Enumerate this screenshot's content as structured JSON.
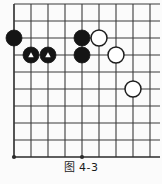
{
  "figure": {
    "caption": "图 4-3",
    "kind": "go-board-diagram"
  },
  "board": {
    "cols": 9,
    "rows": 9,
    "origin_x": 14,
    "origin_y": 21,
    "spacing": 17,
    "line_color": "#3b3b3b",
    "edge_line_color": "#2b2b2b",
    "background": "#fbfbfb",
    "stone_radius": 8.0,
    "black_color": "#151515",
    "white_color": "#ffffff",
    "white_outline": "#1d1d1d",
    "marker_color": "#ffffff",
    "star_points": [
      {
        "col": 0,
        "row": 8
      },
      {
        "col": 4,
        "row": 8
      }
    ],
    "stones": [
      {
        "color": "black",
        "col": 0,
        "row": 1,
        "marker": "none",
        "label": "black-stone-a"
      },
      {
        "color": "black",
        "col": 1,
        "row": 2,
        "marker": "triangle",
        "label": "black-stone-triangle-1"
      },
      {
        "color": "black",
        "col": 2,
        "row": 2,
        "marker": "triangle",
        "label": "black-stone-triangle-2"
      },
      {
        "color": "black",
        "col": 4,
        "row": 1,
        "marker": "none",
        "label": "black-stone-b"
      },
      {
        "color": "black",
        "col": 4,
        "row": 2,
        "marker": "none",
        "label": "black-stone-c"
      },
      {
        "color": "white",
        "col": 5,
        "row": 1,
        "marker": "none",
        "label": "white-stone-a"
      },
      {
        "color": "white",
        "col": 6,
        "row": 2,
        "marker": "none",
        "label": "white-stone-b"
      },
      {
        "color": "white",
        "col": 7,
        "row": 4,
        "marker": "none",
        "label": "white-stone-c"
      }
    ]
  }
}
